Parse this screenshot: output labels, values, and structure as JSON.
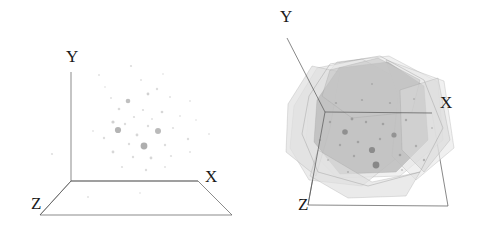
{
  "figure": {
    "background": "#ffffff",
    "width": 477,
    "height": 232,
    "panels": [
      {
        "id": "left",
        "name": "point-cloud-3d",
        "caption": "",
        "axes": {
          "x_label": "X",
          "y_label": "Y",
          "z_label": "Z",
          "x_label_pos": [
            205,
            182
          ],
          "y_label_pos": [
            66,
            62
          ],
          "z_label_pos": [
            31,
            209
          ],
          "origin": [
            71,
            181
          ],
          "y_tip": [
            71,
            72
          ],
          "x_tip": [
            198,
            181
          ],
          "z_tip": [
            40,
            215
          ],
          "floor": [
            [
              71,
              181
            ],
            [
              198,
              181
            ],
            [
              232,
              215
            ],
            [
              40,
              215
            ]
          ]
        },
        "axis_color": "#5a5a5a",
        "point_color": "#8c8c8c",
        "points": [
          {
            "x": 99,
            "y": 75,
            "r": 1.0,
            "a": 0.25
          },
          {
            "x": 131,
            "y": 66,
            "r": 1.1,
            "a": 0.3
          },
          {
            "x": 157,
            "y": 89,
            "r": 1.2,
            "a": 0.3
          },
          {
            "x": 111,
            "y": 98,
            "r": 1.0,
            "a": 0.25
          },
          {
            "x": 148,
            "y": 94,
            "r": 1.4,
            "a": 0.4
          },
          {
            "x": 170,
            "y": 97,
            "r": 1.0,
            "a": 0.25
          },
          {
            "x": 128,
            "y": 101,
            "r": 2.3,
            "a": 0.55
          },
          {
            "x": 190,
            "y": 101,
            "r": 1.0,
            "a": 0.22
          },
          {
            "x": 119,
            "y": 109,
            "r": 1.3,
            "a": 0.32
          },
          {
            "x": 143,
            "y": 110,
            "r": 1.1,
            "a": 0.3
          },
          {
            "x": 162,
            "y": 112,
            "r": 1.3,
            "a": 0.35
          },
          {
            "x": 134,
            "y": 117,
            "r": 1.1,
            "a": 0.3
          },
          {
            "x": 152,
            "y": 119,
            "r": 1.0,
            "a": 0.25
          },
          {
            "x": 113,
            "y": 122,
            "r": 1.6,
            "a": 0.4
          },
          {
            "x": 125,
            "y": 124,
            "r": 1.2,
            "a": 0.3
          },
          {
            "x": 148,
            "y": 126,
            "r": 1.2,
            "a": 0.3
          },
          {
            "x": 118,
            "y": 130,
            "r": 3.1,
            "a": 0.65
          },
          {
            "x": 158,
            "y": 131,
            "r": 3.0,
            "a": 0.6
          },
          {
            "x": 137,
            "y": 135,
            "r": 1.4,
            "a": 0.35
          },
          {
            "x": 173,
            "y": 128,
            "r": 1.1,
            "a": 0.28
          },
          {
            "x": 104,
            "y": 138,
            "r": 1.2,
            "a": 0.3
          },
          {
            "x": 129,
            "y": 144,
            "r": 1.2,
            "a": 0.3
          },
          {
            "x": 144,
            "y": 146,
            "r": 3.4,
            "a": 0.7
          },
          {
            "x": 165,
            "y": 145,
            "r": 1.2,
            "a": 0.3
          },
          {
            "x": 188,
            "y": 139,
            "r": 1.2,
            "a": 0.3
          },
          {
            "x": 209,
            "y": 134,
            "r": 1.0,
            "a": 0.22
          },
          {
            "x": 113,
            "y": 152,
            "r": 1.4,
            "a": 0.35
          },
          {
            "x": 133,
            "y": 157,
            "r": 1.2,
            "a": 0.3
          },
          {
            "x": 151,
            "y": 158,
            "r": 1.4,
            "a": 0.35
          },
          {
            "x": 171,
            "y": 156,
            "r": 1.1,
            "a": 0.28
          },
          {
            "x": 190,
            "y": 152,
            "r": 1.0,
            "a": 0.25
          },
          {
            "x": 52,
            "y": 154,
            "r": 1.1,
            "a": 0.28
          },
          {
            "x": 93,
            "y": 131,
            "r": 1.0,
            "a": 0.22
          },
          {
            "x": 122,
            "y": 167,
            "r": 1.1,
            "a": 0.28
          },
          {
            "x": 146,
            "y": 170,
            "r": 1.2,
            "a": 0.3
          },
          {
            "x": 165,
            "y": 167,
            "r": 1.0,
            "a": 0.25
          },
          {
            "x": 180,
            "y": 116,
            "r": 1.0,
            "a": 0.22
          },
          {
            "x": 105,
            "y": 87,
            "r": 0.9,
            "a": 0.2
          },
          {
            "x": 141,
            "y": 80,
            "r": 1.0,
            "a": 0.25
          },
          {
            "x": 163,
            "y": 74,
            "r": 0.9,
            "a": 0.2
          },
          {
            "x": 196,
            "y": 120,
            "r": 0.9,
            "a": 0.2
          },
          {
            "x": 88,
            "y": 197,
            "r": 1.0,
            "a": 0.25
          },
          {
            "x": 140,
            "y": 193,
            "r": 0.9,
            "a": 0.2
          }
        ]
      },
      {
        "id": "right",
        "name": "convex-hull-polytope-3d",
        "caption": "",
        "axes": {
          "x_label": "X",
          "y_label": "Y",
          "z_label": "Z",
          "x_label_pos": [
            440,
            108
          ],
          "y_label_pos": [
            280,
            22
          ],
          "z_label_pos": [
            298,
            210
          ],
          "origin": [
            325,
            112
          ],
          "y_tip": [
            287,
            38
          ],
          "x_tip": [
            432,
            113
          ],
          "z_tip": [
            308,
            205
          ],
          "frame": [
            [
              325,
              112
            ],
            [
              432,
              113
            ],
            [
              448,
              206
            ],
            [
              308,
              205
            ]
          ]
        },
        "axis_color": "#555555",
        "hull_face_colors": [
          "#c2c2c2",
          "#d4d4d4",
          "#e2e2e2",
          "#ededed"
        ],
        "hull_edge_color": "#9a9a9a",
        "point_color": "#6e6e6e",
        "faces": [
          {
            "name": "face-back-light",
            "fill": "#ebebeb",
            "opacity": 0.75,
            "pts": [
              [
                309,
                96
              ],
              [
                337,
                62
              ],
              [
                389,
                56
              ],
              [
                438,
                82
              ],
              [
                443,
                140
              ],
              [
                400,
                176
              ],
              [
                337,
                178
              ],
              [
                306,
                146
              ]
            ]
          },
          {
            "name": "face-left-light",
            "fill": "#e4e4e4",
            "opacity": 0.7,
            "pts": [
              [
                294,
                106
              ],
              [
                317,
                68
              ],
              [
                362,
                59
              ],
              [
                400,
                80
              ],
              [
                404,
                152
              ],
              [
                362,
                186
              ],
              [
                309,
                180
              ],
              [
                290,
                148
              ]
            ]
          },
          {
            "name": "face-wing-right",
            "fill": "#e8e8e8",
            "opacity": 0.65,
            "pts": [
              [
                386,
                60
              ],
              [
                444,
                81
              ],
              [
                454,
                148
              ],
              [
                416,
                180
              ],
              [
                392,
                156
              ],
              [
                398,
                96
              ]
            ]
          },
          {
            "name": "face-wing-left",
            "fill": "#e0e0e0",
            "opacity": 0.7,
            "pts": [
              [
                288,
                104
              ],
              [
                312,
                66
              ],
              [
                340,
                72
              ],
              [
                330,
                128
              ],
              [
                316,
                176
              ],
              [
                286,
                152
              ]
            ]
          },
          {
            "name": "face-core-main",
            "fill": "#bdbdbd",
            "opacity": 0.85,
            "pts": [
              [
                317,
                100
              ],
              [
                339,
                68
              ],
              [
                388,
                62
              ],
              [
                424,
                86
              ],
              [
                428,
                140
              ],
              [
                396,
                172
              ],
              [
                340,
                174
              ],
              [
                314,
                142
              ]
            ]
          },
          {
            "name": "face-core-upper",
            "fill": "#c7c7c7",
            "opacity": 0.6,
            "pts": [
              [
                330,
                70
              ],
              [
                378,
                58
              ],
              [
                420,
                80
              ],
              [
                412,
                112
              ],
              [
                352,
                118
              ],
              [
                322,
                96
              ]
            ]
          },
          {
            "name": "face-lower-flap",
            "fill": "#dedede",
            "opacity": 0.65,
            "pts": [
              [
                318,
                150
              ],
              [
                372,
                182
              ],
              [
                420,
                172
              ],
              [
                406,
                196
              ],
              [
                348,
                198
              ],
              [
                310,
                176
              ]
            ]
          },
          {
            "name": "face-right-flap",
            "fill": "#d8d8d8",
            "opacity": 0.6,
            "pts": [
              [
                400,
                90
              ],
              [
                438,
                78
              ],
              [
                450,
                140
              ],
              [
                424,
                172
              ],
              [
                402,
                150
              ]
            ]
          }
        ],
        "hull_outline": [
          [
            309,
            96
          ],
          [
            330,
            64
          ],
          [
            380,
            56
          ],
          [
            424,
            80
          ],
          [
            443,
            128
          ],
          [
            420,
            172
          ],
          [
            368,
            186
          ],
          [
            318,
            172
          ],
          [
            302,
            134
          ]
        ],
        "points": [
          {
            "x": 345,
            "y": 132,
            "r": 2.8,
            "a": 0.6
          },
          {
            "x": 372,
            "y": 150,
            "r": 3.1,
            "a": 0.65
          },
          {
            "x": 394,
            "y": 135,
            "r": 2.6,
            "a": 0.55
          },
          {
            "x": 352,
            "y": 119,
            "r": 1.4,
            "a": 0.45
          },
          {
            "x": 366,
            "y": 122,
            "r": 1.2,
            "a": 0.4
          },
          {
            "x": 383,
            "y": 124,
            "r": 1.3,
            "a": 0.4
          },
          {
            "x": 406,
            "y": 120,
            "r": 1.2,
            "a": 0.4
          },
          {
            "x": 358,
            "y": 142,
            "r": 1.3,
            "a": 0.4
          },
          {
            "x": 380,
            "y": 139,
            "r": 1.2,
            "a": 0.38
          },
          {
            "x": 340,
            "y": 145,
            "r": 1.2,
            "a": 0.38
          },
          {
            "x": 354,
            "y": 156,
            "r": 1.2,
            "a": 0.38
          },
          {
            "x": 376,
            "y": 165,
            "r": 3.4,
            "a": 0.7
          },
          {
            "x": 400,
            "y": 155,
            "r": 1.3,
            "a": 0.4
          },
          {
            "x": 416,
            "y": 146,
            "r": 1.2,
            "a": 0.38
          },
          {
            "x": 330,
            "y": 122,
            "r": 1.2,
            "a": 0.38
          },
          {
            "x": 336,
            "y": 103,
            "r": 1.1,
            "a": 0.35
          },
          {
            "x": 362,
            "y": 100,
            "r": 1.1,
            "a": 0.35
          },
          {
            "x": 390,
            "y": 103,
            "r": 1.1,
            "a": 0.35
          },
          {
            "x": 414,
            "y": 99,
            "r": 1.0,
            "a": 0.3
          },
          {
            "x": 320,
            "y": 140,
            "r": 1.1,
            "a": 0.35
          },
          {
            "x": 348,
            "y": 172,
            "r": 1.1,
            "a": 0.32
          },
          {
            "x": 328,
            "y": 160,
            "r": 1.0,
            "a": 0.3
          },
          {
            "x": 424,
            "y": 160,
            "r": 1.2,
            "a": 0.4
          },
          {
            "x": 432,
            "y": 128,
            "r": 1.0,
            "a": 0.3
          },
          {
            "x": 372,
            "y": 84,
            "r": 1.0,
            "a": 0.3
          },
          {
            "x": 402,
            "y": 170,
            "r": 1.1,
            "a": 0.32
          }
        ]
      }
    ]
  }
}
